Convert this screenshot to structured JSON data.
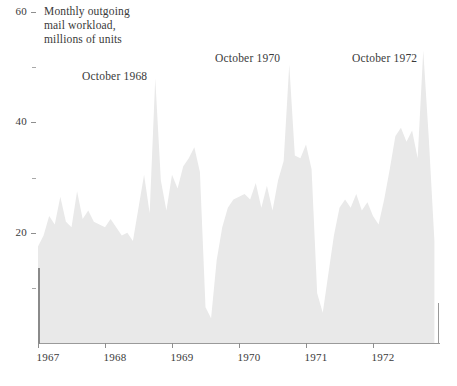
{
  "chart_data": {
    "type": "area",
    "title": "Monthly outgoing mail workload, millions of units",
    "title_lines": [
      "Monthly outgoing",
      "mail workload,",
      "millions of units"
    ],
    "xlabel": "",
    "ylabel": "millions of units",
    "ylim": [
      0,
      60
    ],
    "xlim": [
      "1967-01",
      "1972-12"
    ],
    "grid": false,
    "legend": null,
    "fill_color": "#e9e9e9",
    "axis_color": "#8e8e8e",
    "text_color": "#3a3a3a",
    "y_ticks": [
      {
        "value": 60,
        "label": "60"
      },
      {
        "value": 50,
        "label": ""
      },
      {
        "value": 40,
        "label": "40"
      },
      {
        "value": 30,
        "label": ""
      },
      {
        "value": 20,
        "label": "20"
      },
      {
        "value": 10,
        "label": ""
      }
    ],
    "x_ticks": [
      {
        "value": "1967",
        "label": "1967"
      },
      {
        "value": "1968",
        "label": "1968"
      },
      {
        "value": "1969",
        "label": "1969"
      },
      {
        "value": "1970",
        "label": "1970"
      },
      {
        "value": "1971",
        "label": "1971"
      },
      {
        "value": "1972",
        "label": "1972"
      }
    ],
    "annotations": [
      {
        "text": "October 1968",
        "x": "1968-10",
        "y": 52
      },
      {
        "text": "October 1970",
        "x": "1970-10",
        "y": 56
      },
      {
        "text": "October 1972",
        "x": "1972-10",
        "y": 56
      }
    ],
    "x": [
      "1967-01",
      "1967-02",
      "1967-03",
      "1967-04",
      "1967-05",
      "1967-06",
      "1967-07",
      "1967-08",
      "1967-09",
      "1967-10",
      "1967-11",
      "1967-12",
      "1968-01",
      "1968-02",
      "1968-03",
      "1968-04",
      "1968-05",
      "1968-06",
      "1968-07",
      "1968-08",
      "1968-09",
      "1968-10",
      "1968-11",
      "1968-12",
      "1969-01",
      "1969-02",
      "1969-03",
      "1969-04",
      "1969-05",
      "1969-06",
      "1969-07",
      "1969-08",
      "1969-09",
      "1969-10",
      "1969-11",
      "1969-12",
      "1970-01",
      "1970-02",
      "1970-03",
      "1970-04",
      "1970-05",
      "1970-06",
      "1970-07",
      "1970-08",
      "1970-09",
      "1970-10",
      "1970-11",
      "1970-12",
      "1971-01",
      "1971-02",
      "1971-03",
      "1971-04",
      "1971-05",
      "1971-06",
      "1971-07",
      "1971-08",
      "1971-09",
      "1971-10",
      "1971-11",
      "1971-12",
      "1972-01",
      "1972-02",
      "1972-03",
      "1972-04",
      "1972-05",
      "1972-06",
      "1972-07",
      "1972-08",
      "1972-09",
      "1972-10",
      "1972-11",
      "1972-12"
    ],
    "values": [
      17.5,
      19.5,
      23.0,
      21.5,
      26.5,
      22.0,
      21.0,
      27.5,
      22.5,
      24.0,
      22.0,
      21.5,
      21.0,
      22.5,
      21.0,
      19.5,
      20.0,
      18.5,
      24.5,
      30.5,
      23.5,
      48.0,
      29.5,
      24.0,
      30.5,
      28.0,
      32.0,
      33.5,
      35.5,
      31.0,
      6.5,
      4.5,
      15.0,
      21.0,
      24.5,
      26.0,
      26.5,
      27.0,
      26.0,
      29.0,
      24.5,
      28.5,
      24.0,
      29.5,
      33.0,
      50.5,
      34.0,
      33.5,
      36.0,
      31.5,
      9.0,
      5.5,
      12.5,
      19.5,
      24.5,
      26.0,
      24.5,
      27.0,
      24.0,
      25.5,
      23.0,
      21.5,
      26.0,
      31.5,
      37.5,
      39.0,
      36.5,
      38.5,
      33.5,
      53.0,
      37.0,
      18.5
    ]
  }
}
